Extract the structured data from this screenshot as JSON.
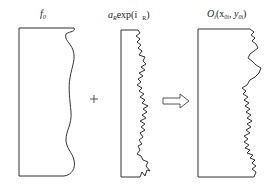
{
  "diagram": {
    "panels": [
      {
        "id": "f0",
        "label_main": "f",
        "label_sub": "0"
      },
      {
        "id": "random-phase",
        "label_a": "a",
        "label_a_sub": "R",
        "label_exp": "exp(i",
        "label_phi_sub": "R",
        "label_close": ")"
      },
      {
        "id": "object",
        "label_main": "O",
        "label_main_sub": "i",
        "label_open": "(x",
        "label_x_sub": "0i",
        "label_sep": ", y",
        "label_y_sub": "0i",
        "label_close": ")"
      }
    ],
    "operators": {
      "plus": "+",
      "arrow": "hollow-right-arrow"
    },
    "colors": {
      "stroke": "#333333",
      "background": "#ffffff"
    }
  }
}
